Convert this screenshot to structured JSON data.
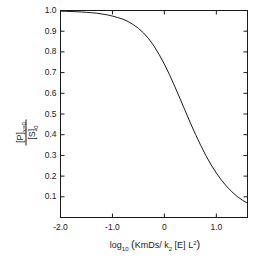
{
  "chart_data": {
    "type": "line",
    "title": "",
    "xlabel": "log 10 (KmDs/ k2 [E] L2)",
    "xlabel_parts": {
      "log": "log",
      "log_base": "10",
      "open_bracket": "(",
      "numerator": "KmDs/",
      "k": "k",
      "k_sub": "2",
      "enzyme": "[E]",
      "L": "L",
      "L_sup": "2",
      "close_bracket": ")"
    },
    "ylabel": "[P]x=0 / [S]0",
    "ylabel_parts": {
      "numerator_main": "[P]",
      "numerator_sub": "x=0",
      "denominator_main": "[S]",
      "denominator_sub": "0"
    },
    "xlim": [
      -2.0,
      1.6
    ],
    "ylim": [
      0.0,
      1.0
    ],
    "xticks": [
      -2.0,
      -1.0,
      0.0,
      1.0
    ],
    "xtick_labels": [
      "-2.0",
      "-1.0",
      "0",
      "1.0"
    ],
    "yticks": [
      0.1,
      0.2,
      0.3,
      0.4,
      0.5,
      0.6,
      0.7,
      0.8,
      0.9,
      1.0
    ],
    "ytick_labels": [
      "0.1",
      "0.2",
      "0.3",
      "0.4",
      "0.5",
      "0.6",
      "0.7",
      "0.8",
      "0.9",
      "1.0"
    ],
    "grid": false,
    "legend": "none",
    "ticks_direction": "inward",
    "frame": "full-box",
    "line_color": "#1a1a1a",
    "line_width": 1.0,
    "background_color": "#ffffff",
    "midpoint_x": -0.48,
    "series": [
      {
        "name": "normalized product concentration",
        "x": [
          -2.0,
          -1.9,
          -1.8,
          -1.7,
          -1.6,
          -1.5,
          -1.4,
          -1.3,
          -1.2,
          -1.1,
          -1.0,
          -0.9,
          -0.8,
          -0.7,
          -0.6,
          -0.5,
          -0.4,
          -0.3,
          -0.2,
          -0.1,
          0.0,
          0.1,
          0.2,
          0.3,
          0.4,
          0.5,
          0.6,
          0.7,
          0.8,
          0.9,
          1.0,
          1.1,
          1.2,
          1.3,
          1.4,
          1.5,
          1.6
        ],
        "y": [
          0.997,
          0.996,
          0.995,
          0.994,
          0.993,
          0.991,
          0.989,
          0.987,
          0.983,
          0.979,
          0.973,
          0.966,
          0.958,
          0.947,
          0.932,
          0.914,
          0.891,
          0.863,
          0.828,
          0.787,
          0.741,
          0.689,
          0.633,
          0.575,
          0.516,
          0.457,
          0.401,
          0.348,
          0.299,
          0.254,
          0.215,
          0.18,
          0.15,
          0.124,
          0.102,
          0.084,
          0.069
        ]
      }
    ]
  }
}
